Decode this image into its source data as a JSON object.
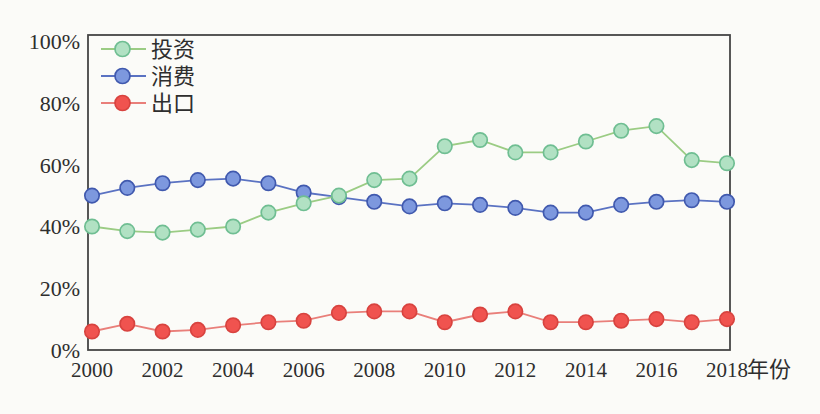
{
  "page": {
    "background": "#fbfbf8",
    "text_color": "#2e2e2e",
    "border_color": "#454545"
  },
  "chart_data": {
    "type": "line",
    "title": "",
    "xlabel": "年份",
    "ylabel": "",
    "grid": false,
    "legend_position": "top-left-inside",
    "ylim": [
      0,
      102
    ],
    "y_ticks": [
      0,
      20,
      40,
      60,
      80,
      100
    ],
    "y_tick_labels": [
      "0%",
      "20%",
      "40%",
      "60%",
      "80%",
      "100%"
    ],
    "x_tick_labels": [
      "2000",
      "2002",
      "2004",
      "2006",
      "2008",
      "2010",
      "2012",
      "2014",
      "2016",
      "2018"
    ],
    "x": [
      2000,
      2001,
      2002,
      2003,
      2004,
      2005,
      2006,
      2007,
      2008,
      2009,
      2010,
      2011,
      2012,
      2013,
      2014,
      2015,
      2016,
      2017,
      2018
    ],
    "series": [
      {
        "id": "investment",
        "name": "投资",
        "line_color": "#9bcc84",
        "marker_fill": "#b1e1c3",
        "marker_stroke": "#6fbe92",
        "values": [
          40,
          38.5,
          38,
          39,
          40,
          44.5,
          47.5,
          50,
          55,
          55.5,
          66,
          68,
          64,
          64,
          67.5,
          71,
          72.5,
          61.5,
          60.5
        ]
      },
      {
        "id": "consumption",
        "name": "消费",
        "line_color": "#5a72c2",
        "marker_fill": "#7d98de",
        "marker_stroke": "#4059ae",
        "values": [
          50,
          52.5,
          54,
          55,
          55.5,
          54,
          51,
          49.5,
          48,
          46.5,
          47.5,
          47,
          46,
          44.5,
          44.5,
          47,
          48,
          48.5,
          48
        ]
      },
      {
        "id": "export",
        "name": "出口",
        "line_color": "#e97f7a",
        "marker_fill": "#f0534f",
        "marker_stroke": "#d8433f",
        "values": [
          6,
          8.5,
          6,
          6.5,
          8,
          9,
          9.5,
          12,
          12.5,
          12.5,
          9,
          11.5,
          12.5,
          9,
          9,
          9.5,
          10,
          9,
          10
        ]
      }
    ]
  }
}
